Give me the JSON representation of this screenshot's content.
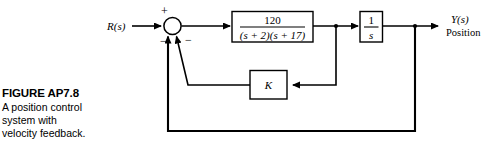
{
  "figure": {
    "caption_title": "FIGURE AP7.8",
    "caption_line1": "A position control",
    "caption_line2": "system with",
    "caption_line3": "velocity feedback."
  },
  "diagram": {
    "type": "control-block-diagram",
    "input_label": "R(s)",
    "output_label": "Y(s)",
    "output_sublabel": "Position",
    "summing_junction": {
      "name": "summing-junction",
      "signs": [
        "+",
        "−",
        "−"
      ],
      "sign_plus": "+",
      "sign_minus_inner": "−",
      "sign_minus_outer": "−"
    },
    "blocks": [
      {
        "name": "plant-block",
        "numerator": "120",
        "denominator": "(s + 2)(s + 17)",
        "label": "120/((s + 2)(s + 17))"
      },
      {
        "name": "integrator-block",
        "numerator": "1",
        "denominator": "s",
        "label": "1/s"
      },
      {
        "name": "gain-block-k",
        "label": "K"
      }
    ],
    "feedback_paths": [
      {
        "name": "inner-velocity-feedback",
        "through": "K",
        "sign": "−"
      },
      {
        "name": "outer-position-feedback",
        "through": "unity",
        "sign": "−"
      }
    ]
  },
  "colors": {
    "ink": "#000000",
    "paper": "#ffffff"
  }
}
